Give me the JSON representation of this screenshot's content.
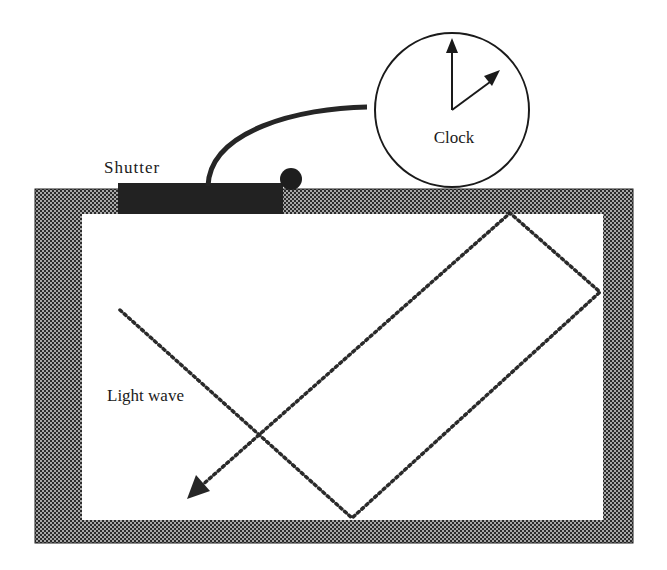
{
  "diagram": {
    "type": "physics-illustration",
    "labels": {
      "shutter": "Shutter",
      "clock": "Clock",
      "light_wave": "Light wave"
    },
    "colors": {
      "wall_dark": "#2b2b2b",
      "wall_light": "#9a9a9a",
      "shutter": "#222222",
      "ink": "#1a1a1a",
      "background": "#ffffff"
    },
    "components": [
      {
        "id": "box",
        "description": "Hatched rectangular mirrored chamber"
      },
      {
        "id": "shutter",
        "description": "Dark shutter plate on top wall with knob"
      },
      {
        "id": "cable",
        "description": "Curved cable connecting shutter to clock"
      },
      {
        "id": "clock",
        "description": "Circular clock with two hands"
      },
      {
        "id": "light-path",
        "description": "Dotted light ray bouncing off walls, ending in arrow"
      }
    ]
  }
}
